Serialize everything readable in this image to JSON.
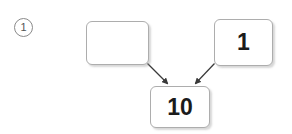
{
  "worksheet": {
    "problem_number": "1",
    "problem_marker_style": "circled-number",
    "diagram_type": "number-bond-addition",
    "boxes": {
      "addend_left": {
        "value": "",
        "placeholder": "",
        "role": "missing-addend",
        "filled": false
      },
      "addend_right": {
        "value": "1",
        "role": "addend",
        "filled": true
      },
      "sum": {
        "value": "10",
        "role": "sum",
        "filled": true
      }
    },
    "arrows": [
      {
        "name": "arrow-left-to-sum",
        "from": "addend_left",
        "to": "sum",
        "direction": "down-right"
      },
      {
        "name": "arrow-right-to-sum",
        "from": "addend_right",
        "to": "sum",
        "direction": "down-left"
      }
    ],
    "colors": {
      "page_background": "#ffffff",
      "box_border": "#adadad",
      "box_fill": "#ffffff",
      "text": "#1b1b1b",
      "marker_border": "#8a8a8a",
      "marker_text": "#555555",
      "arrow": "#3a3a3a"
    }
  }
}
